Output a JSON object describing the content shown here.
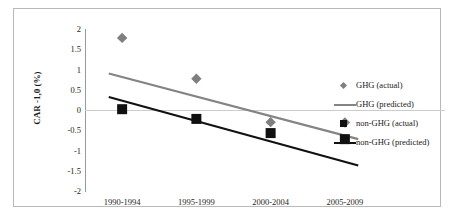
{
  "chart_data": {
    "type": "scatter",
    "title": "",
    "xlabel": "",
    "ylabel": "CAR -1,0 (%)",
    "categories": [
      "1990-1994",
      "1995-1999",
      "2000-2004",
      "2005-2009"
    ],
    "ylim": [
      -2,
      2
    ],
    "yticks": [
      2,
      1.5,
      1,
      0.5,
      0,
      -0.5,
      -1,
      -1.5,
      -2
    ],
    "ytick_labels": [
      "2",
      "1.5",
      "1",
      "0.5",
      "0",
      "-0.5",
      "-1",
      "-1.5",
      "-2"
    ],
    "grid": "zero-line-only",
    "legend_position": "right",
    "series": [
      {
        "name": "GHG (actual)",
        "marker": "diamond",
        "color": "#7f7f7f",
        "values": [
          1.78,
          0.77,
          -0.3,
          -0.31
        ]
      },
      {
        "name": "GHG (predicted)",
        "marker": "line",
        "color": "#848484",
        "endpoints": [
          0.9,
          -0.72
        ]
      },
      {
        "name": "non-GHG (actual)",
        "marker": "square",
        "color": "#111111",
        "values": [
          0.02,
          -0.22,
          -0.57,
          -0.72
        ]
      },
      {
        "name": "non-GHG (predicted)",
        "marker": "line",
        "color": "#111111",
        "endpoints": [
          0.32,
          -1.37
        ]
      }
    ]
  },
  "legend": {
    "items": [
      {
        "label": "GHG (actual)",
        "key": "diamond-marker-icon"
      },
      {
        "label": "GHG (predicted)",
        "key": "gray-line-icon"
      },
      {
        "label": "non-GHG (actual)",
        "key": "square-marker-icon"
      },
      {
        "label": "non-GHG (predicted)",
        "key": "black-line-icon"
      }
    ]
  },
  "colors": {
    "ghg": "#7f7f7f",
    "non_ghg": "#111111",
    "gridline": "#cccccc",
    "axis": "#9a9a9a",
    "frame": "#b9b9b9"
  }
}
